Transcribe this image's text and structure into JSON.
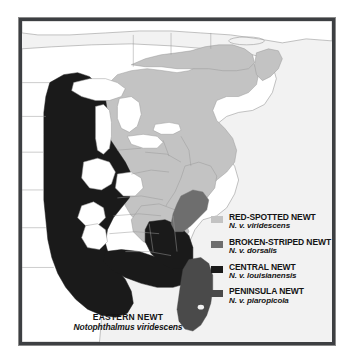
{
  "figure": {
    "kind": "species-range-map",
    "title_common": "EASTERN NEWT",
    "title_scientific": "Notophthalmus viridescens",
    "region": "Eastern North America"
  },
  "colors": {
    "ocean": "#f2f2f2",
    "unshaded_land": "#ffffff",
    "border_frame": "#3d3f42",
    "state_line": "#9a9a9a",
    "red_spotted": "#c3c3c3",
    "broken_striped": "#6e6e6e",
    "central": "#1a1a1a",
    "peninsula": "#4a4a4a"
  },
  "legend": {
    "items": [
      {
        "common": "RED-SPOTTED NEWT",
        "scientific": "N. v. viridescens",
        "swatch": "#c3c3c3",
        "swatch_name": "legend-swatch-red-spotted"
      },
      {
        "common": "BROKEN-STRIPED NEWT",
        "scientific": "N. v. dorsalis",
        "swatch": "#6e6e6e",
        "swatch_name": "legend-swatch-broken-striped"
      },
      {
        "common": "CENTRAL NEWT",
        "scientific": "N. v. louisianensis",
        "swatch": "#1a1a1a",
        "swatch_name": "legend-swatch-central"
      },
      {
        "common": "PENINSULA NEWT",
        "scientific": "N. v. piaropicola",
        "swatch": "#4a4a4a",
        "swatch_name": "legend-swatch-peninsula"
      }
    ]
  }
}
